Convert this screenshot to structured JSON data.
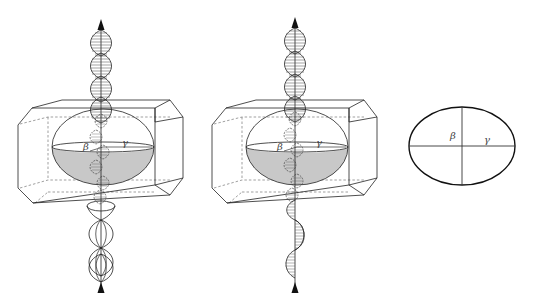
{
  "figures": [
    {
      "id": "figure-a",
      "description": "Crystal prism with indicatrix ellipsoid; light propagates along axis; upper helix (circular), lower (two opposite circular components)",
      "axis_x": 101,
      "offset_x": 0,
      "upper_wave": "circular-helix",
      "lower_wave": "double-circular",
      "labels": {
        "beta": "β",
        "gamma": "γ"
      }
    },
    {
      "id": "figure-b",
      "description": "Crystal prism with indicatrix ellipsoid; upper helix (circular), lower plane-polarized sine wave",
      "axis_x": 295,
      "offset_x": 194,
      "upper_wave": "circular-helix",
      "lower_wave": "linear-sine",
      "labels": {
        "beta": "β",
        "gamma": "γ"
      }
    }
  ],
  "section": {
    "id": "figure-c",
    "description": "Elliptical section of indicatrix with axes",
    "labels": {
      "beta": "β",
      "gamma": "γ"
    }
  },
  "colors": {
    "line": "#222222",
    "hidden": "#777777",
    "fill_lower_half": "#c8c8c8"
  }
}
